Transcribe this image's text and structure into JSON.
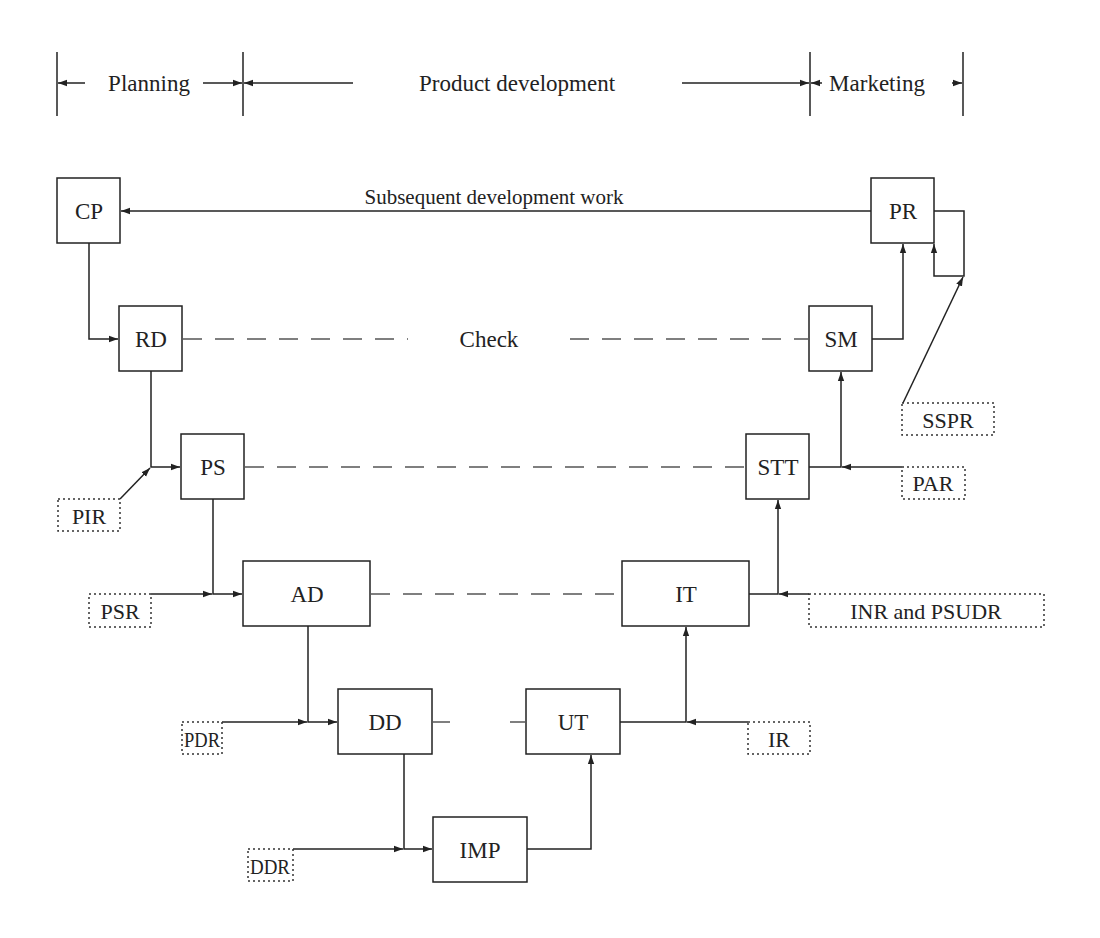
{
  "phases": [
    {
      "label": "Planning"
    },
    {
      "label": "Product development"
    },
    {
      "label": "Marketing"
    }
  ],
  "feedback_label": "Subsequent development work",
  "check_label": "Check",
  "nodes": {
    "cp": "CP",
    "pr": "PR",
    "rd": "RD",
    "sm": "SM",
    "ps": "PS",
    "stt": "STT",
    "ad": "AD",
    "it": "IT",
    "dd": "DD",
    "ut": "UT",
    "imp": "IMP"
  },
  "reviews": {
    "pir": "PIR",
    "psr": "PSR",
    "pdr": "PDR",
    "ddr": "DDR",
    "ir": "IR",
    "inr": "INR and PSUDR",
    "par": "PAR",
    "sspr": "SSPR"
  },
  "colors": {
    "line": "#222222",
    "dash": "#555555",
    "background": "#ffffff"
  }
}
